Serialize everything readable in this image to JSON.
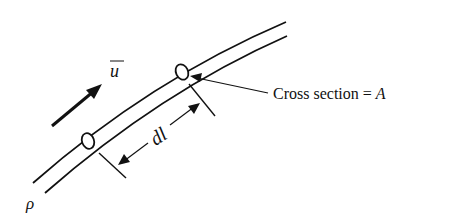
{
  "diagram": {
    "type": "stream-tube",
    "labels": {
      "velocity": "u",
      "length": "dl",
      "cross_section_prefix": "Cross section = ",
      "cross_section_var": "A",
      "density": "ρ"
    },
    "colors": {
      "ink": "#111111",
      "background": "#ffffff"
    }
  }
}
